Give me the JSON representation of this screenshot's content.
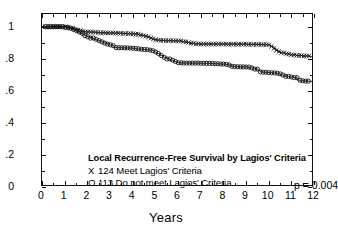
{
  "figure": {
    "background": "#ffffff",
    "ink": "#111111"
  },
  "axes": {
    "x": {
      "label": "Years",
      "ticks": [
        0,
        1,
        2,
        3,
        4,
        5,
        6,
        7,
        8,
        9,
        10,
        11,
        12
      ],
      "tick_labels": [
        "0",
        "1",
        "2",
        "3",
        "4",
        "5",
        "6",
        "7",
        "8",
        "9",
        "10",
        "11",
        "12"
      ],
      "range": [
        0,
        12
      ],
      "minor_ticks_per_interval": 1
    },
    "y": {
      "label": "",
      "ticks": [
        0,
        0.2,
        0.4,
        0.6,
        0.8,
        1.0
      ],
      "tick_labels": [
        "0",
        ".2",
        ".4",
        ".6",
        ".8",
        "1"
      ],
      "range": [
        0,
        1.08
      ],
      "minor_ticks": [
        0.1,
        0.3,
        0.5,
        0.7,
        0.9
      ]
    },
    "frame": true,
    "grid": false
  },
  "legend": {
    "title": "Local Recurrence-Free Survival by Lagios' Criteria",
    "rows": [
      {
        "marker": "X",
        "text": "124 Meet Lagios' Criteria"
      },
      {
        "marker": "O",
        "text": "113 Do not meet Lagios' Criteria"
      }
    ],
    "pvalue": "p = 0.004"
  },
  "chart_data": {
    "type": "line",
    "title": "Local Recurrence-Free Survival by Lagios' Criteria",
    "subtitle": "",
    "xlabel": "Years",
    "ylabel": "",
    "xlim": [
      0,
      12
    ],
    "ylim": [
      0,
      1.08
    ],
    "grid": false,
    "legend_position": "inside-lower-left",
    "annotations": [
      {
        "text": "p = 0.004",
        "x": 10.0,
        "y": 0.17
      }
    ],
    "series": [
      {
        "name": "124 Meet Lagios' Criteria",
        "marker": "X",
        "n": 124,
        "type": "kaplan-meier-step",
        "x": [
          0.0,
          0.25,
          0.6,
          0.9,
          1.1,
          1.25,
          1.4,
          1.55,
          1.7,
          1.8,
          1.9,
          2.0,
          2.1,
          2.25,
          2.4,
          2.6,
          2.8,
          3.0,
          3.2,
          3.4,
          3.6,
          3.8,
          4.0,
          4.15,
          4.3,
          4.45,
          4.6,
          4.7,
          4.8,
          4.9,
          5.0,
          5.1,
          5.25,
          5.5,
          5.8,
          6.0,
          6.2,
          6.4,
          6.6,
          6.8,
          7.0,
          7.3,
          7.6,
          7.9,
          8.2,
          8.5,
          8.8,
          9.1,
          9.4,
          9.7,
          10.0,
          10.15,
          10.3,
          10.4,
          10.5,
          10.6,
          10.8,
          11.0,
          11.3,
          11.6,
          11.9,
          12.0
        ],
        "y": [
          1.0,
          1.0,
          1.0,
          1.0,
          0.995,
          0.99,
          0.985,
          0.98,
          0.975,
          0.97,
          0.968,
          0.967,
          0.966,
          0.965,
          0.963,
          0.962,
          0.961,
          0.96,
          0.959,
          0.958,
          0.957,
          0.956,
          0.955,
          0.952,
          0.948,
          0.944,
          0.94,
          0.935,
          0.928,
          0.922,
          0.918,
          0.915,
          0.913,
          0.912,
          0.911,
          0.91,
          0.905,
          0.9,
          0.895,
          0.892,
          0.89,
          0.89,
          0.89,
          0.89,
          0.889,
          0.889,
          0.889,
          0.888,
          0.888,
          0.887,
          0.886,
          0.875,
          0.862,
          0.85,
          0.842,
          0.835,
          0.828,
          0.822,
          0.818,
          0.815,
          0.812,
          0.81
        ]
      },
      {
        "name": "113 Do not meet Lagios' Criteria",
        "marker": "O",
        "n": 113,
        "type": "kaplan-meier-step",
        "x": [
          0.0,
          0.3,
          0.7,
          1.0,
          1.2,
          1.35,
          1.5,
          1.6,
          1.7,
          1.8,
          1.9,
          2.0,
          2.15,
          2.3,
          2.45,
          2.6,
          2.75,
          2.9,
          3.0,
          3.1,
          3.2,
          3.4,
          3.6,
          3.8,
          4.0,
          4.1,
          4.2,
          4.3,
          4.4,
          4.5,
          4.6,
          4.7,
          4.8,
          4.9,
          5.0,
          5.1,
          5.25,
          5.4,
          5.55,
          5.7,
          5.85,
          6.0,
          6.2,
          6.5,
          6.8,
          7.0,
          7.3,
          7.6,
          7.9,
          8.1,
          8.25,
          8.4,
          8.5,
          8.6,
          8.8,
          9.0,
          9.2,
          9.4,
          9.6,
          9.7,
          9.8,
          10.0,
          10.2,
          10.4,
          10.5,
          10.6,
          10.8,
          11.0,
          11.2,
          11.35,
          11.5,
          11.7,
          11.9,
          12.0
        ],
        "y": [
          1.0,
          1.0,
          1.0,
          0.995,
          0.99,
          0.982,
          0.975,
          0.966,
          0.958,
          0.95,
          0.943,
          0.936,
          0.928,
          0.92,
          0.912,
          0.904,
          0.896,
          0.89,
          0.885,
          0.88,
          0.868,
          0.867,
          0.866,
          0.865,
          0.864,
          0.862,
          0.86,
          0.858,
          0.857,
          0.856,
          0.855,
          0.854,
          0.852,
          0.848,
          0.84,
          0.83,
          0.818,
          0.806,
          0.796,
          0.788,
          0.78,
          0.772,
          0.77,
          0.77,
          0.77,
          0.769,
          0.768,
          0.766,
          0.764,
          0.762,
          0.758,
          0.75,
          0.748,
          0.747,
          0.746,
          0.745,
          0.74,
          0.732,
          0.722,
          0.715,
          0.712,
          0.71,
          0.708,
          0.706,
          0.702,
          0.695,
          0.686,
          0.682,
          0.678,
          0.662,
          0.658,
          0.656,
          0.654,
          0.652
        ]
      }
    ]
  }
}
